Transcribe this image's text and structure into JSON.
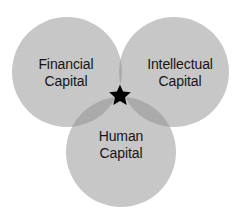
{
  "diagram": {
    "type": "venn",
    "background_color": "#ffffff",
    "circle_fill": "#c8c8c8",
    "overlap_pair_fill": "#a9a9a9",
    "overlap_triple_fill": "#8f8f8f",
    "text_color": "#151515",
    "marker_color": "#000000",
    "circles": [
      {
        "id": "financial",
        "label_line1": "Financial",
        "label_line2": "Capital",
        "cx": 67,
        "cy": 72,
        "r": 55
      },
      {
        "id": "intellectual",
        "label_line1": "Intellectual",
        "label_line2": "Capital",
        "cx": 174,
        "cy": 72,
        "r": 55
      },
      {
        "id": "human",
        "label_line1": "Human",
        "label_line2": "Capital",
        "cx": 121,
        "cy": 152,
        "r": 55
      }
    ],
    "marker": {
      "name": "star",
      "glyph": "★",
      "cx": 120,
      "cy": 94,
      "size": 17
    }
  }
}
